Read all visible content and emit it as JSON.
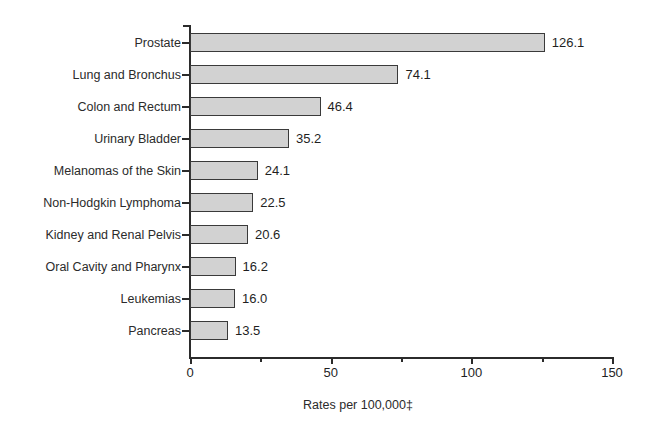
{
  "chart_data": {
    "type": "bar",
    "orientation": "horizontal",
    "title": "",
    "subtitle": "",
    "xlabel": "Rates per 100,000‡",
    "ylabel": "",
    "xlim": [
      0,
      150
    ],
    "xticks": [
      0,
      50,
      100,
      150
    ],
    "xtick_labels": [
      "0",
      "50",
      "100",
      "150"
    ],
    "minor_xticks": [
      25,
      75,
      125
    ],
    "grid": false,
    "legend": null,
    "categories": [
      "Prostate",
      "Lung and Bronchus",
      "Colon and Rectum",
      "Urinary Bladder",
      "Melanomas of the Skin",
      "Non-Hodgkin Lymphoma",
      "Kidney and Renal Pelvis",
      "Oral Cavity and Pharynx",
      "Leukemias",
      "Pancreas"
    ],
    "values": [
      126.1,
      74.1,
      46.4,
      35.2,
      24.1,
      22.5,
      20.6,
      16.2,
      16.0,
      13.5
    ],
    "value_labels": [
      "126.1",
      "74.1",
      "46.4",
      "35.2",
      "24.1",
      "22.5",
      "20.6",
      "16.2",
      "16.0",
      "13.5"
    ],
    "bar_fill_color": "#d2d2d2",
    "bar_edge_color": "#3a3a3a",
    "axis_color": "#2b2b2b",
    "text_color": "#1f1f1f",
    "background_color": "#ffffff"
  }
}
